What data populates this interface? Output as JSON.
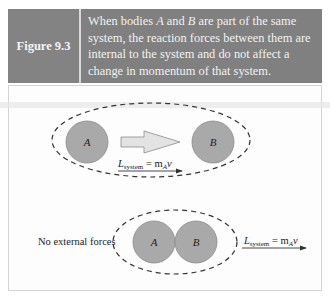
{
  "figure": {
    "label": "Figure 9.3",
    "caption_parts": [
      "When bodies ",
      "A",
      " and ",
      "B",
      " are part of the same system, the reaction forces between them are internal to the system and do not affect a change in momentum of that system."
    ]
  },
  "diagram_top": {
    "body_a": "A",
    "body_b": "B",
    "momentum_label": "L",
    "momentum_sub": "system",
    "momentum_eq": " = m",
    "momentum_sub2": "A",
    "momentum_v": "v"
  },
  "diagram_bottom": {
    "note": "No external forces",
    "body_a": "A",
    "body_b": "B",
    "momentum_label": "L",
    "momentum_sub": "system",
    "momentum_eq": " = m",
    "momentum_sub2": "A",
    "momentum_v": "v"
  },
  "colors": {
    "header_bg": "#808080",
    "circle_fill": "#a9a9a9",
    "arrow_fill": "#e3e3e3"
  }
}
